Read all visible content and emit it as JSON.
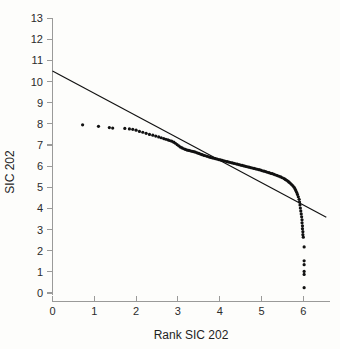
{
  "figure": {
    "background_color": "#fdfdfb",
    "ink_color": "#111111",
    "axis_color": "#9a9a99"
  },
  "chart_data": {
    "type": "scatter",
    "title": "",
    "subtitle": "",
    "xlabel": "Rank SIC 202",
    "ylabel": "SIC 202",
    "xlim": [
      0,
      6.75
    ],
    "ylim": [
      0,
      13
    ],
    "xticks": [
      0,
      1,
      2,
      3,
      4,
      5,
      6
    ],
    "yticks": [
      0,
      1,
      2,
      3,
      4,
      5,
      6,
      7,
      8,
      9,
      10,
      11,
      12,
      13
    ],
    "xtick_labels": [
      "0",
      "1",
      "2",
      "3",
      "4",
      "5",
      "6"
    ],
    "ytick_labels": [
      "0",
      "1",
      "2",
      "3",
      "4",
      "5",
      "6",
      "7",
      "8",
      "9",
      "10",
      "11",
      "12",
      "13"
    ],
    "grid": false,
    "legend": false,
    "legend_position": "none",
    "annotations": [],
    "series": [
      {
        "name": "Rank-size data points",
        "type": "scatter",
        "marker": "filled-circle",
        "marker_size_px": 2.0,
        "color": "#111111",
        "points": [
          [
            0.72,
            7.95
          ],
          [
            1.1,
            7.88
          ],
          [
            1.36,
            7.82
          ],
          [
            1.44,
            7.8
          ],
          [
            1.73,
            7.78
          ],
          [
            1.84,
            7.76
          ],
          [
            1.92,
            7.74
          ],
          [
            2.0,
            7.7
          ],
          [
            2.08,
            7.64
          ],
          [
            2.16,
            7.6
          ],
          [
            2.24,
            7.55
          ],
          [
            2.32,
            7.5
          ],
          [
            2.4,
            7.46
          ],
          [
            2.47,
            7.42
          ],
          [
            2.54,
            7.38
          ],
          [
            2.6,
            7.34
          ],
          [
            2.66,
            7.3
          ],
          [
            2.71,
            7.27
          ],
          [
            2.76,
            7.24
          ],
          [
            2.8,
            7.21
          ],
          [
            2.85,
            7.18
          ],
          [
            2.9,
            7.13
          ],
          [
            2.94,
            7.08
          ],
          [
            2.98,
            7.02
          ],
          [
            3.02,
            6.96
          ],
          [
            3.06,
            6.9
          ],
          [
            3.1,
            6.86
          ],
          [
            3.14,
            6.82
          ],
          [
            3.18,
            6.79
          ],
          [
            3.22,
            6.76
          ],
          [
            3.26,
            6.74
          ],
          [
            3.3,
            6.72
          ],
          [
            3.34,
            6.7
          ],
          [
            3.38,
            6.68
          ],
          [
            3.42,
            6.66
          ],
          [
            3.46,
            6.63
          ],
          [
            3.5,
            6.6
          ],
          [
            3.54,
            6.57
          ],
          [
            3.58,
            6.54
          ],
          [
            3.62,
            6.51
          ],
          [
            3.66,
            6.49
          ],
          [
            3.7,
            6.46
          ],
          [
            3.74,
            6.44
          ],
          [
            3.78,
            6.41
          ],
          [
            3.82,
            6.39
          ],
          [
            3.86,
            6.37
          ],
          [
            3.9,
            6.35
          ],
          [
            3.94,
            6.33
          ],
          [
            3.98,
            6.31
          ],
          [
            4.02,
            6.29
          ],
          [
            4.06,
            6.27
          ],
          [
            4.1,
            6.25
          ],
          [
            4.14,
            6.23
          ],
          [
            4.18,
            6.21
          ],
          [
            4.22,
            6.19
          ],
          [
            4.26,
            6.17
          ],
          [
            4.3,
            6.15
          ],
          [
            4.34,
            6.13
          ],
          [
            4.38,
            6.11
          ],
          [
            4.42,
            6.09
          ],
          [
            4.46,
            6.07
          ],
          [
            4.5,
            6.05
          ],
          [
            4.54,
            6.03
          ],
          [
            4.58,
            6.01
          ],
          [
            4.62,
            5.99
          ],
          [
            4.66,
            5.97
          ],
          [
            4.7,
            5.95
          ],
          [
            4.74,
            5.93
          ],
          [
            4.78,
            5.91
          ],
          [
            4.82,
            5.89
          ],
          [
            4.86,
            5.87
          ],
          [
            4.9,
            5.85
          ],
          [
            4.94,
            5.83
          ],
          [
            4.98,
            5.81
          ],
          [
            5.02,
            5.78
          ],
          [
            5.06,
            5.76
          ],
          [
            5.1,
            5.74
          ],
          [
            5.14,
            5.71
          ],
          [
            5.18,
            5.69
          ],
          [
            5.22,
            5.66
          ],
          [
            5.26,
            5.64
          ],
          [
            5.3,
            5.61
          ],
          [
            5.34,
            5.58
          ],
          [
            5.38,
            5.55
          ],
          [
            5.42,
            5.52
          ],
          [
            5.46,
            5.49
          ],
          [
            5.5,
            5.45
          ],
          [
            5.54,
            5.41
          ],
          [
            5.57,
            5.37
          ],
          [
            5.6,
            5.33
          ],
          [
            5.63,
            5.29
          ],
          [
            5.66,
            5.24
          ],
          [
            5.69,
            5.19
          ],
          [
            5.72,
            5.13
          ],
          [
            5.75,
            5.07
          ],
          [
            5.78,
            5.0
          ],
          [
            5.8,
            4.93
          ],
          [
            5.82,
            4.85
          ],
          [
            5.84,
            4.76
          ],
          [
            5.86,
            4.66
          ],
          [
            5.88,
            4.55
          ],
          [
            5.9,
            4.43
          ],
          [
            5.91,
            4.3
          ],
          [
            5.92,
            4.16
          ],
          [
            5.93,
            4.02
          ],
          [
            5.94,
            3.88
          ],
          [
            5.95,
            3.74
          ],
          [
            5.96,
            3.6
          ],
          [
            5.97,
            3.46
          ],
          [
            5.97,
            3.32
          ],
          [
            5.98,
            3.18
          ],
          [
            5.98,
            3.04
          ],
          [
            5.99,
            2.9
          ],
          [
            5.99,
            2.76
          ],
          [
            6.0,
            2.64
          ],
          [
            6.02,
            2.18
          ],
          [
            6.02,
            1.52
          ],
          [
            6.02,
            1.34
          ],
          [
            6.02,
            1.02
          ],
          [
            6.02,
            0.88
          ],
          [
            6.02,
            0.25
          ]
        ]
      },
      {
        "name": "Fitted regression line",
        "type": "line",
        "color": "#111111",
        "endpoints": [
          [
            0.0,
            10.5
          ],
          [
            6.55,
            3.58
          ]
        ],
        "slope": -1.056,
        "intercept": 10.5
      }
    ]
  }
}
